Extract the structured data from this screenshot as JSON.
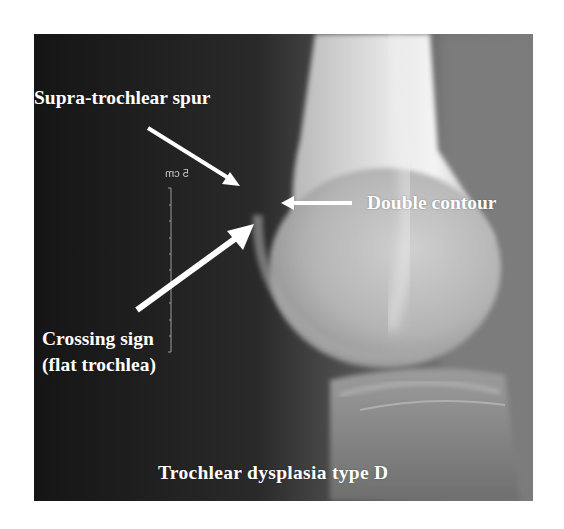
{
  "figure": {
    "type": "lateral knee radiograph",
    "annotations": {
      "supra_trochlear_spur": "Supra-trochlear spur",
      "double_contour": "Double contour",
      "crossing_sign_line1": "Crossing sign",
      "crossing_sign_line2": "(flat trochlea)",
      "classification": "Trochlear dysplasia type D"
    },
    "scale_marker": "5 cm",
    "colors": {
      "background": "#ffffff",
      "xray_dark": "#1a1a1a",
      "bone_light": "#d8d8d8",
      "annotation_text": "#ffffff",
      "arrow": "#ffffff"
    }
  }
}
